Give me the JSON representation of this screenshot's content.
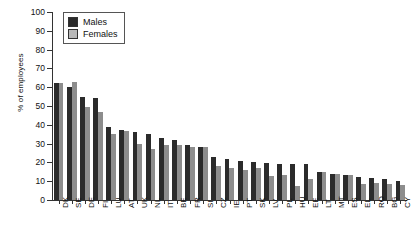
{
  "chart_data": {
    "type": "bar",
    "title": "",
    "xlabel": "",
    "ylabel": "% of employees",
    "ylim": [
      0,
      100
    ],
    "yticks": [
      0,
      10,
      20,
      30,
      40,
      50,
      60,
      70,
      80,
      90,
      100
    ],
    "grid": false,
    "legend_position": "top-left",
    "categories": [
      "DK",
      "SE",
      "DE",
      "FI",
      "LU",
      "AT",
      "UK",
      "NL",
      "IT",
      "BE",
      "FR",
      "SI",
      "CZ",
      "IE",
      "PT",
      "SK",
      "LV",
      "PL",
      "HU",
      "EE",
      "LT",
      "MT",
      "ES",
      "EL",
      "RO",
      "BG",
      "CY"
    ],
    "series": [
      {
        "name": "Males",
        "color": "#2b2b2b",
        "values": [
          62,
          60,
          55,
          54,
          39,
          37,
          36,
          35,
          33,
          32,
          29,
          28,
          23,
          22,
          20.5,
          20,
          19.5,
          19,
          19,
          19,
          15,
          14,
          13.5,
          12,
          11.5,
          11,
          10
        ]
      },
      {
        "name": "Females",
        "color": "#8d8d8d",
        "values": [
          62,
          63,
          49.5,
          47,
          35,
          36.5,
          30,
          27,
          29.5,
          29,
          28,
          28,
          18,
          17,
          16,
          17,
          13,
          13.5,
          7.5,
          11,
          15,
          14,
          13.5,
          8.5,
          9,
          8.5,
          8
        ]
      }
    ]
  },
  "legend": {
    "items": [
      {
        "label": "Males"
      },
      {
        "label": "Females"
      }
    ]
  }
}
